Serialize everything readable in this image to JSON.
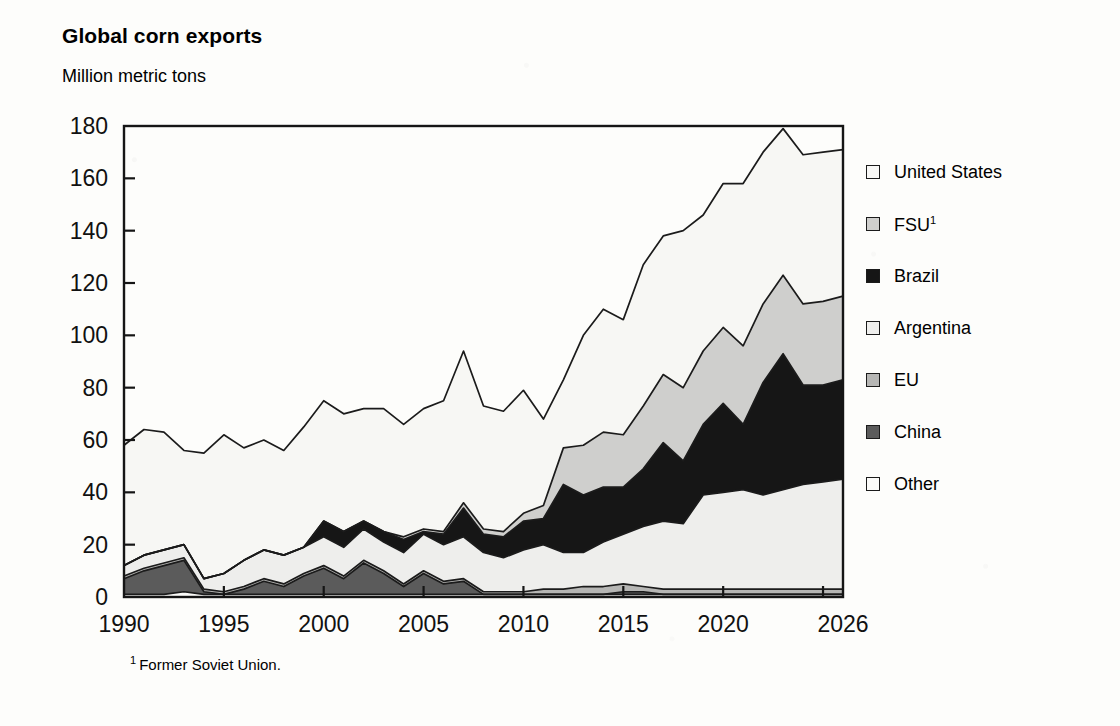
{
  "chart_data": {
    "type": "area",
    "stacked": true,
    "title": "Global corn exports",
    "subtitle": "Million metric tons",
    "ylabel": "Million metric tons",
    "xlabel": "",
    "footnote_marker": "1",
    "footnote": "Former Soviet Union.",
    "grid": false,
    "legend_position": "right",
    "xlim": [
      1990,
      2026
    ],
    "ylim": [
      0,
      180
    ],
    "ytick_step": 20,
    "yticks": [
      "0",
      "20",
      "40",
      "60",
      "80",
      "100",
      "120",
      "140",
      "160",
      "180"
    ],
    "xticks": [
      "1990",
      "1995",
      "2000",
      "2005",
      "2010",
      "2015",
      "2020",
      "2026"
    ],
    "xtick_values": [
      1990,
      1995,
      2000,
      2005,
      2010,
      2015,
      2020,
      2026
    ],
    "x": [
      1990,
      1991,
      1992,
      1993,
      1994,
      1995,
      1996,
      1997,
      1998,
      1999,
      2000,
      2001,
      2002,
      2003,
      2004,
      2005,
      2006,
      2007,
      2008,
      2009,
      2010,
      2011,
      2012,
      2013,
      2014,
      2015,
      2016,
      2017,
      2018,
      2019,
      2020,
      2021,
      2022,
      2023,
      2024,
      2025,
      2026
    ],
    "stack_order_bottom_to_top": [
      "Other",
      "China",
      "EU",
      "Argentina",
      "Brazil",
      "FSU",
      "United States"
    ],
    "series": [
      {
        "name": "United States",
        "color": "#f7f7f4",
        "legend_swatch": "white",
        "values": [
          46,
          48,
          45,
          36,
          48,
          53,
          43,
          42,
          40,
          46,
          46,
          45,
          43,
          47,
          43,
          46,
          50,
          58,
          47,
          46,
          47,
          33,
          26,
          42,
          47,
          44,
          54,
          53,
          60,
          52,
          55,
          62,
          58,
          56,
          57,
          57,
          56
        ]
      },
      {
        "name": "FSU",
        "color": "#cfcfcd",
        "legend_swatch": "light-gray",
        "values": [
          0,
          0,
          0,
          0,
          0,
          0,
          0,
          0,
          0,
          0,
          0,
          0,
          0,
          0,
          1,
          1,
          1,
          2,
          2,
          2,
          3,
          5,
          14,
          19,
          21,
          20,
          24,
          26,
          28,
          28,
          29,
          30,
          30,
          30,
          31,
          32,
          32
        ]
      },
      {
        "name": "Brazil",
        "color": "#161616",
        "legend_swatch": "black",
        "values": [
          0,
          0,
          0,
          0,
          0,
          0,
          0,
          0,
          0,
          0,
          6,
          6,
          3,
          4,
          5,
          1,
          4,
          11,
          7,
          8,
          11,
          10,
          26,
          22,
          21,
          18,
          22,
          30,
          24,
          27,
          34,
          25,
          43,
          52,
          38,
          37,
          38
        ]
      },
      {
        "name": "Argentina",
        "color": "#eeeeec",
        "legend_swatch": "off-white",
        "values": [
          4,
          5,
          5,
          5,
          4,
          7,
          10,
          11,
          11,
          10,
          11,
          11,
          12,
          11,
          12,
          14,
          14,
          16,
          15,
          13,
          16,
          17,
          14,
          13,
          17,
          19,
          23,
          26,
          25,
          36,
          37,
          38,
          36,
          38,
          40,
          41,
          42
        ]
      },
      {
        "name": "EU",
        "color": "#b6b6b4",
        "legend_swatch": "medium-gray",
        "values": [
          1,
          1,
          1,
          1,
          1,
          1,
          1,
          1,
          1,
          1,
          1,
          1,
          1,
          1,
          1,
          1,
          1,
          1,
          1,
          1,
          1,
          2,
          2,
          3,
          3,
          3,
          2,
          2,
          2,
          2,
          2,
          2,
          2,
          2,
          2,
          2,
          2
        ]
      },
      {
        "name": "China",
        "color": "#5b5b5b",
        "legend_swatch": "dark-gray",
        "values": [
          6,
          9,
          11,
          12,
          1,
          0,
          2,
          5,
          3,
          7,
          10,
          6,
          12,
          8,
          3,
          8,
          4,
          5,
          0,
          0,
          0,
          0,
          0,
          0,
          0,
          1,
          1,
          0,
          0,
          0,
          0,
          0,
          0,
          0,
          0,
          0,
          0
        ]
      },
      {
        "name": "Other",
        "color": "#fafaf8",
        "legend_swatch": "near-white",
        "values": [
          1,
          1,
          1,
          2,
          1,
          1,
          1,
          1,
          1,
          1,
          1,
          1,
          1,
          1,
          1,
          1,
          1,
          1,
          1,
          1,
          1,
          1,
          1,
          1,
          1,
          1,
          1,
          1,
          1,
          1,
          1,
          1,
          1,
          1,
          1,
          1,
          1
        ]
      }
    ],
    "totals": [
      58,
      64,
      63,
      56,
      55,
      62,
      57,
      60,
      56,
      65,
      75,
      70,
      72,
      71,
      65,
      71,
      75,
      93,
      73,
      70,
      79,
      68,
      83,
      100,
      110,
      106,
      127,
      138,
      140,
      145,
      158,
      158,
      170,
      179,
      169,
      170,
      171
    ]
  },
  "legend": {
    "items": [
      {
        "label": "United States",
        "sup": "",
        "swatch": "#f8f8f6",
        "name": "united-states"
      },
      {
        "label": "FSU",
        "sup": "1",
        "swatch": "#cfcfcd",
        "name": "fsu"
      },
      {
        "label": "Brazil",
        "sup": "",
        "swatch": "#161616",
        "name": "brazil"
      },
      {
        "label": "Argentina",
        "sup": "",
        "swatch": "#efefed",
        "name": "argentina"
      },
      {
        "label": "EU",
        "sup": "",
        "swatch": "#b6b6b4",
        "name": "eu"
      },
      {
        "label": "China",
        "sup": "",
        "swatch": "#5b5b5b",
        "name": "china"
      },
      {
        "label": "Other",
        "sup": "",
        "swatch": "#fbfbf9",
        "name": "other"
      }
    ]
  }
}
